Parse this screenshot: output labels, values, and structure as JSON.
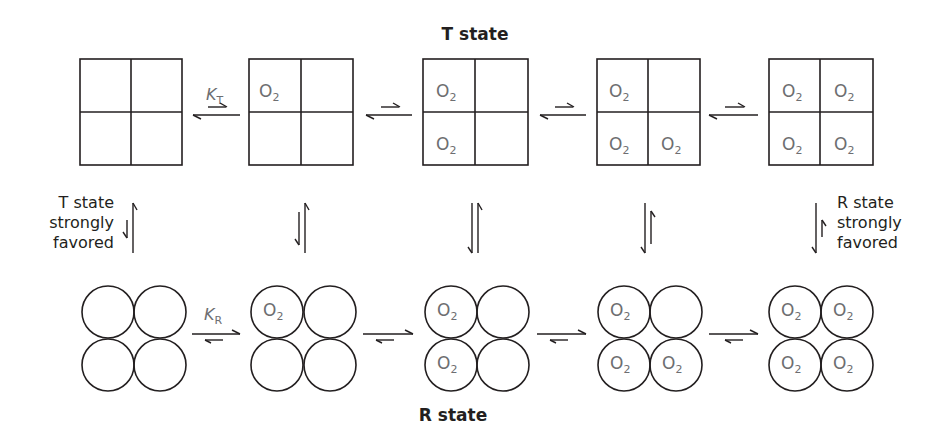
{
  "diagram": {
    "title_top": "T state",
    "title_bottom": "R state",
    "left_note": [
      "T state",
      "strongly",
      "favored"
    ],
    "right_note": [
      "R state",
      "strongly",
      "favored"
    ],
    "ligand": "O",
    "ligand_sub": "2",
    "k_t": {
      "main": "K",
      "sub": "T"
    },
    "k_r": {
      "main": "K",
      "sub": "R"
    },
    "t_states": [
      {
        "bound": [
          false,
          false,
          false,
          false
        ]
      },
      {
        "bound": [
          true,
          false,
          false,
          false
        ]
      },
      {
        "bound": [
          true,
          false,
          true,
          false
        ]
      },
      {
        "bound": [
          true,
          false,
          true,
          true
        ]
      },
      {
        "bound": [
          true,
          true,
          true,
          true
        ]
      }
    ],
    "r_states": [
      {
        "bound": [
          false,
          false,
          false,
          false
        ]
      },
      {
        "bound": [
          true,
          false,
          false,
          false
        ]
      },
      {
        "bound": [
          true,
          false,
          true,
          false
        ]
      },
      {
        "bound": [
          true,
          false,
          true,
          true
        ]
      },
      {
        "bound": [
          true,
          true,
          true,
          true
        ]
      }
    ],
    "horizontal_equilibria_T": "favor left (unbound direction)",
    "horizontal_equilibria_R": "favor right (bound direction)",
    "vertical_equilibria": [
      "T strongly favored",
      "T favored",
      "balanced",
      "R favored",
      "R strongly favored"
    ],
    "colors": {
      "line": "#231f20",
      "ligand_text": "#6d6e71",
      "background": "#ffffff"
    }
  }
}
